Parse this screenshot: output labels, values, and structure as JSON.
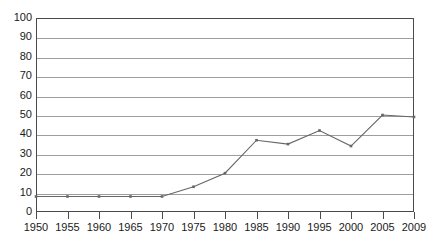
{
  "chart_data": {
    "type": "line",
    "title": "",
    "xlabel": "",
    "ylabel": "",
    "ylim": [
      0,
      100
    ],
    "ytick_step": 10,
    "yticks": [
      100,
      90,
      80,
      70,
      60,
      50,
      40,
      30,
      20,
      10,
      0
    ],
    "grid": true,
    "legend": "none",
    "categories": [
      "1950",
      "1955",
      "1960",
      "1965",
      "1970",
      "1975",
      "1980",
      "1985",
      "1990",
      "1995",
      "2000",
      "2005",
      "2009"
    ],
    "x": [
      1950,
      1955,
      1960,
      1965,
      1970,
      1975,
      1980,
      1985,
      1990,
      1995,
      2000,
      2005,
      2009
    ],
    "series": [
      {
        "name": "series-1",
        "values": [
          8,
          8,
          8,
          8,
          8,
          13,
          20,
          37,
          35,
          42,
          34,
          50,
          49
        ],
        "color": "#666666",
        "marker": "square"
      }
    ]
  },
  "axes": {
    "y_min_label": "0",
    "y_max_label": "100",
    "x_min_label": "1950",
    "x_max_label": "2009"
  },
  "style": {
    "grid_color": "#9e9e9e",
    "border_color": "#4a4a4a",
    "line_color": "#666666",
    "text_color": "#1a1a1a",
    "background": "#ffffff"
  }
}
